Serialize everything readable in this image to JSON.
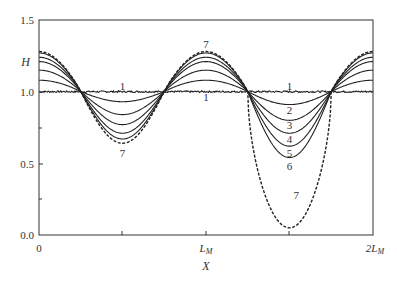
{
  "chart_data": {
    "type": "line",
    "title": "",
    "xlabel": "X",
    "ylabel": "H",
    "xlim": [
      0,
      2
    ],
    "ylim": [
      0.0,
      1.5
    ],
    "x_ticks": [
      {
        "value": 0,
        "label": "0"
      },
      {
        "value": 0.5,
        "label": ""
      },
      {
        "value": 1,
        "label": "L_M"
      },
      {
        "value": 1.5,
        "label": ""
      },
      {
        "value": 2,
        "label": "2L_M"
      }
    ],
    "y_ticks": [
      {
        "value": 0.0,
        "label": "0.0"
      },
      {
        "value": 0.25,
        "label": ""
      },
      {
        "value": 0.5,
        "label": "0.5"
      },
      {
        "value": 0.75,
        "label": ""
      },
      {
        "value": 1.0,
        "label": "1.0"
      },
      {
        "value": 1.5,
        "label": "1.5"
      }
    ],
    "x_units": "L_M",
    "crossings_x": [
      0.28,
      0.73,
      1.28,
      1.73
    ],
    "series": [
      {
        "name": "1",
        "style": "solid-noisy",
        "peak": 1.0,
        "left_trough": 1.0,
        "right_trough": 1.0
      },
      {
        "name": "2",
        "style": "solid",
        "peak": 1.08,
        "left_trough": 0.93,
        "right_trough": 0.91
      },
      {
        "name": "3",
        "style": "solid",
        "peak": 1.15,
        "left_trough": 0.84,
        "right_trough": 0.8
      },
      {
        "name": "4",
        "style": "solid",
        "peak": 1.21,
        "left_trough": 0.77,
        "right_trough": 0.71
      },
      {
        "name": "5",
        "style": "solid",
        "peak": 1.24,
        "left_trough": 0.71,
        "right_trough": 0.62
      },
      {
        "name": "6",
        "style": "solid",
        "peak": 1.27,
        "left_trough": 0.67,
        "right_trough": 0.54
      },
      {
        "name": "7",
        "style": "dashed",
        "peak": 1.28,
        "left_trough": 0.64,
        "right_trough": 0.05
      }
    ],
    "annotations": [
      {
        "text": "1",
        "x": 0.5,
        "y": 1.04
      },
      {
        "text": "1",
        "x": 1.0,
        "y": 0.96
      },
      {
        "text": "7",
        "x": 1.0,
        "y": 1.33
      },
      {
        "text": "7",
        "x": 0.5,
        "y": 0.57
      },
      {
        "text": "1",
        "x": 1.5,
        "y": 1.04
      },
      {
        "text": "2",
        "x": 1.5,
        "y": 0.87
      },
      {
        "text": "3",
        "x": 1.5,
        "y": 0.77
      },
      {
        "text": "4",
        "x": 1.5,
        "y": 0.67
      },
      {
        "text": "5",
        "x": 1.5,
        "y": 0.57
      },
      {
        "text": "6",
        "x": 1.5,
        "y": 0.48
      },
      {
        "text": "7",
        "x": 1.54,
        "y": 0.28
      }
    ],
    "grid": false,
    "legend": "none (inline curve labels)"
  },
  "labels": {
    "ylabel": "H",
    "xlabel": "X",
    "y15": "1.5",
    "y10": "1.0",
    "y05": "0.5",
    "y00": "0.0",
    "x0": "0",
    "xL": "L",
    "xLsub": "M",
    "x2L": "2L",
    "x2Lsub": "M"
  }
}
